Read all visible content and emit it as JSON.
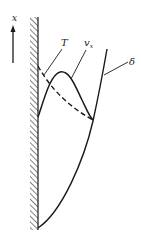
{
  "figure": {
    "axis": {
      "label": "x",
      "direction": "up"
    },
    "labels": {
      "temperature": "T",
      "velocity": "v",
      "velocity_subscript": "x",
      "thickness": "δ"
    },
    "curves": [
      {
        "name": "T",
        "style": "dashed"
      },
      {
        "name": "v_x",
        "style": "solid"
      },
      {
        "name": "delta",
        "style": "solid"
      }
    ],
    "colors": {
      "ink": "#1a1a1a",
      "background": "#ffffff"
    }
  }
}
